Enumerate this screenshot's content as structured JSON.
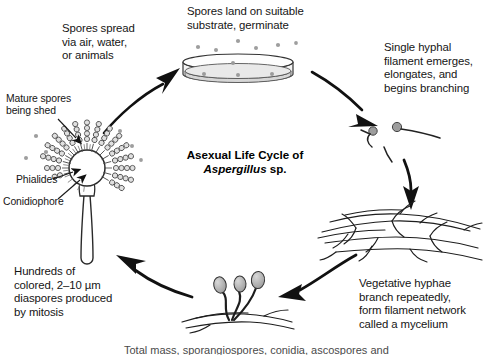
{
  "figure": {
    "title_line1": "Asexual Life Cycle of",
    "title_species": "Aspergillus",
    "title_suffix": " sp.",
    "background_color": "#ffffff",
    "ink_color": "#151515",
    "spore_fill": "#b9b9b9"
  },
  "labels": {
    "spores_spread": "Spores spread\nvia air, water,\nor animals",
    "spores_land": "Spores land on suitable\nsubstrate, germinate",
    "single_hypha": "Single hyphal\nfilament emerges,\nelongates, and\nbegins branching",
    "vegetative": "Vegetative hyphae\nbranch repeatedly,\nform filament network\ncalled a mycelium",
    "hundreds": "Hundreds of\ncolored, 2–10 µm\ndiaspores produced\nby mitosis",
    "mature_spores": "Mature spores\nbeing shed",
    "phialides": "Phialides",
    "conidiophore": "Conidiophore",
    "footer_clipped": "Total mass, sporangiospores, conidia, ascospores and"
  },
  "stages": [
    {
      "name": "petri-dish",
      "caption_key": "spores_land"
    },
    {
      "name": "germinating-spores",
      "caption_key": "single_hypha"
    },
    {
      "name": "mycelium-network",
      "caption_key": "vegetative"
    },
    {
      "name": "young-conidiophores",
      "caption_key": "hundreds"
    },
    {
      "name": "mature-conidiophore",
      "caption_key": "mature_spores"
    }
  ],
  "arrows": [
    {
      "name": "arrow-to-petri-dish",
      "direction": "up-right"
    },
    {
      "name": "arrow-to-germinating-spores",
      "direction": "down-right"
    },
    {
      "name": "arrow-to-mycelium",
      "direction": "down"
    },
    {
      "name": "arrow-to-conidiophores",
      "direction": "left"
    },
    {
      "name": "arrow-to-mature-conidiophore",
      "direction": "up-left"
    }
  ]
}
